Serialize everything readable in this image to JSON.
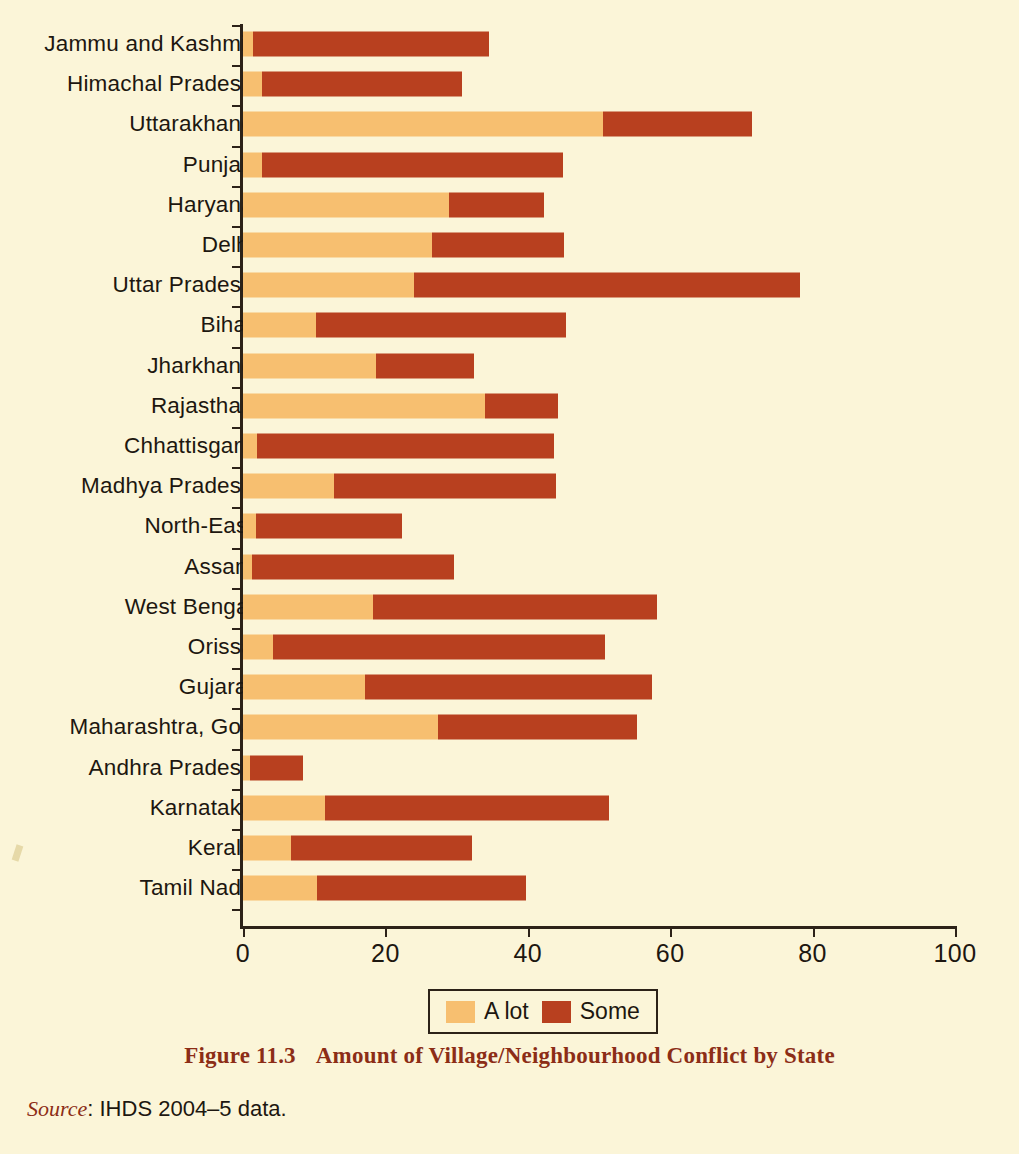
{
  "chart_data": {
    "type": "bar",
    "orientation": "horizontal",
    "stacked": true,
    "title": "Amount of Village/Neighbourhood Conflict by State",
    "figure_number": "Figure 11.3",
    "xlabel": "",
    "ylabel": "",
    "xlim": [
      0,
      100
    ],
    "xticks": [
      0,
      20,
      40,
      60,
      80,
      100
    ],
    "xtick_labels": [
      "0",
      "20",
      "40",
      "60",
      "80",
      "100"
    ],
    "grid": false,
    "legend_position": "bottom-center",
    "categories": [
      "Jammu and Kashmir",
      "Himachal Pradesh",
      "Uttarakhand",
      "Punjab",
      "Haryana",
      "Delhi",
      "Uttar Pradesh",
      "Bihar",
      "Jharkhand",
      "Rajasthan",
      "Chhattisgarh",
      "Madhya Pradesh",
      "North-East",
      "Assam",
      "West Bengal",
      "Orissa",
      "Gujarat",
      "Maharashtra, Goa",
      "Andhra Pradesh",
      "Karnataka",
      "Kerala",
      "Tamil Nadu"
    ],
    "series": [
      {
        "name": "A lot",
        "color": "#f7bf70",
        "values": [
          1.4,
          2.6,
          50.5,
          2.7,
          29.0,
          26.5,
          24.0,
          10.2,
          18.7,
          34.0,
          2.0,
          12.8,
          1.8,
          1.2,
          18.3,
          4.2,
          17.1,
          27.4,
          1.0,
          11.5,
          6.7,
          10.4
        ]
      },
      {
        "name": "Some",
        "color": "#b8401f",
        "values": [
          33.1,
          28.2,
          21.0,
          42.3,
          13.3,
          18.6,
          54.3,
          35.2,
          13.8,
          10.2,
          41.7,
          31.2,
          20.6,
          28.5,
          39.9,
          46.6,
          40.3,
          28.0,
          7.4,
          39.9,
          25.4,
          29.4
        ]
      }
    ],
    "totals": [
      34.5,
      30.8,
      71.5,
      45.0,
      42.3,
      45.1,
      78.3,
      45.4,
      32.5,
      44.2,
      43.7,
      44.0,
      22.4,
      29.7,
      58.2,
      50.8,
      57.4,
      55.4,
      8.4,
      51.4,
      32.1,
      39.8
    ]
  },
  "legend": {
    "items": [
      {
        "label": "A lot",
        "color": "#f7bf70"
      },
      {
        "label": "Some",
        "color": "#b8401f"
      }
    ]
  },
  "caption": {
    "figure_number": "Figure 11.3",
    "title": "Amount of Village/Neighbourhood Conflict by State"
  },
  "source": {
    "word": "Source",
    "text": ": IHDS 2004–5 data."
  },
  "colors": {
    "background": "#fbf5d8",
    "a_lot": "#f7bf70",
    "some": "#b8401f",
    "axis": "#2c2218",
    "caption": "#8c2d16"
  }
}
